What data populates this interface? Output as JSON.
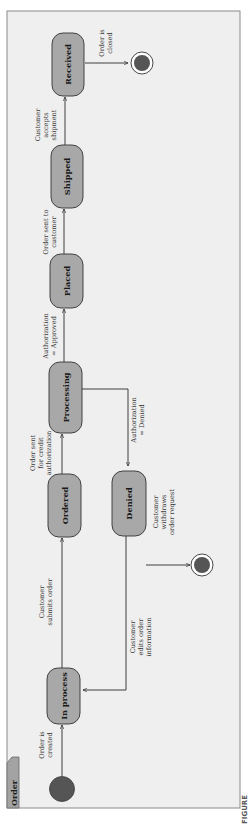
{
  "diagram": {
    "type": "UML state machine diagram",
    "orientation": "rotated 90 degrees counter-clockwise",
    "frame_label": "Order",
    "caption_partial": "FIGURE",
    "colors": {
      "state_fill": "#a8a8a8",
      "frame_fill": "#efefef",
      "initial_fill": "#555555",
      "final_fill": "#555555"
    },
    "states": [
      {
        "id": "in_process",
        "label": "In process"
      },
      {
        "id": "ordered",
        "label": "Ordered"
      },
      {
        "id": "processing",
        "label": "Processing"
      },
      {
        "id": "placed",
        "label": "Placed"
      },
      {
        "id": "shipped",
        "label": "Shipped"
      },
      {
        "id": "received",
        "label": "Received"
      },
      {
        "id": "denied",
        "label": "Denied"
      }
    ],
    "pseudostates": [
      {
        "id": "initial",
        "kind": "initial"
      },
      {
        "id": "final_denied",
        "kind": "final"
      },
      {
        "id": "final_received",
        "kind": "final"
      }
    ],
    "transitions": [
      {
        "from": "initial",
        "to": "in_process",
        "label_lines": [
          "Order is",
          "created"
        ]
      },
      {
        "from": "in_process",
        "to": "ordered",
        "label_lines": [
          "Customer",
          "submits order"
        ]
      },
      {
        "from": "ordered",
        "to": "processing",
        "label_lines": [
          "Order sent",
          "for credit",
          "authorization"
        ]
      },
      {
        "from": "processing",
        "to": "placed",
        "label_lines": [
          "Authorization",
          "= Approved"
        ]
      },
      {
        "from": "processing",
        "to": "denied",
        "label_lines": [
          "Authorization",
          "= Denied"
        ]
      },
      {
        "from": "placed",
        "to": "shipped",
        "label_lines": [
          "Order sent to",
          "customer"
        ]
      },
      {
        "from": "shipped",
        "to": "received",
        "label_lines": [
          "Customer",
          "accepts",
          "shipment"
        ]
      },
      {
        "from": "received",
        "to": "final_received",
        "label_lines": [
          "Order is",
          "closed"
        ]
      },
      {
        "from": "denied",
        "to": "in_process",
        "label_lines": [
          "Customer",
          "edits order",
          "information"
        ]
      },
      {
        "from": "denied",
        "to": "final_denied",
        "label_lines": [
          "Customer",
          "withdraws",
          "order request"
        ]
      }
    ]
  }
}
